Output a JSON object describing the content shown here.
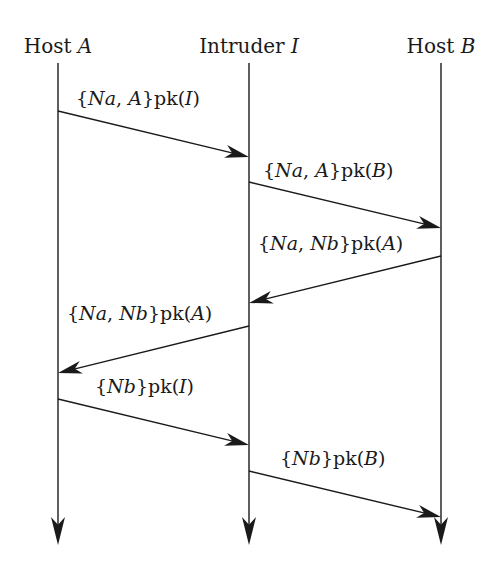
{
  "diagram": {
    "type": "sequence",
    "colors": {
      "ink": "#1a1a1a",
      "background": "#ffffff"
    },
    "participants": [
      {
        "id": "A",
        "label_prefix": "Host",
        "label_var": "A",
        "x": 58
      },
      {
        "id": "I",
        "label_prefix": "Intruder",
        "label_var": "I",
        "x": 249
      },
      {
        "id": "B",
        "label_prefix": "Host",
        "label_var": "B",
        "x": 441
      }
    ],
    "lifeline": {
      "top": 63,
      "bottom": 545
    },
    "messages": [
      {
        "from": "A",
        "to": "I",
        "y1": 111,
        "y2": 157,
        "parts": [
          [
            "{",
            ""
          ],
          [
            "Na",
            "it"
          ],
          [
            ", ",
            ""
          ],
          [
            "A",
            "it"
          ],
          [
            "}pk(",
            ""
          ],
          [
            "I",
            "it"
          ],
          [
            ")",
            ""
          ]
        ],
        "text": "{Na, A}pk(I)",
        "label_x": 76,
        "label_y": 105
      },
      {
        "from": "I",
        "to": "B",
        "y1": 182,
        "y2": 228,
        "parts": [
          [
            "{",
            ""
          ],
          [
            "Na",
            "it"
          ],
          [
            ", ",
            ""
          ],
          [
            "A",
            "it"
          ],
          [
            "}pk(",
            ""
          ],
          [
            "B",
            "it"
          ],
          [
            ")",
            ""
          ]
        ],
        "text": "{Na, A}pk(B)",
        "label_x": 263,
        "label_y": 177
      },
      {
        "from": "B",
        "to": "I",
        "y1": 256,
        "y2": 303,
        "parts": [
          [
            "{",
            ""
          ],
          [
            "Na",
            "it"
          ],
          [
            ", ",
            ""
          ],
          [
            "Nb",
            "it"
          ],
          [
            "}pk(",
            ""
          ],
          [
            "A",
            "it"
          ],
          [
            ")",
            ""
          ]
        ],
        "text": "{Na, Nb}pk(A)",
        "label_x": 258,
        "label_y": 250
      },
      {
        "from": "I",
        "to": "A",
        "y1": 326,
        "y2": 373,
        "parts": [
          [
            "{",
            ""
          ],
          [
            "Na",
            "it"
          ],
          [
            ", ",
            ""
          ],
          [
            "Nb",
            "it"
          ],
          [
            "}pk(",
            ""
          ],
          [
            "A",
            "it"
          ],
          [
            ")",
            ""
          ]
        ],
        "text": "{Na, Nb}pk(A)",
        "label_x": 67,
        "label_y": 320
      },
      {
        "from": "A",
        "to": "I",
        "y1": 399,
        "y2": 445,
        "parts": [
          [
            "{",
            ""
          ],
          [
            "Nb",
            "it"
          ],
          [
            "}pk(",
            ""
          ],
          [
            "I",
            "it"
          ],
          [
            ")",
            ""
          ]
        ],
        "text": "{Nb}pk(I)",
        "label_x": 95,
        "label_y": 393
      },
      {
        "from": "I",
        "to": "B",
        "y1": 471,
        "y2": 517,
        "parts": [
          [
            "{",
            ""
          ],
          [
            "Nb",
            "it"
          ],
          [
            "}pk(",
            ""
          ],
          [
            "B",
            "it"
          ],
          [
            ")",
            ""
          ]
        ],
        "text": "{Nb}pk(B)",
        "label_x": 280,
        "label_y": 465
      }
    ]
  }
}
